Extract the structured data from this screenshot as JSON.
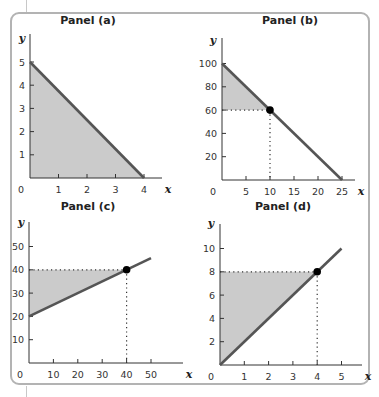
{
  "chart_data": [
    {
      "type": "line",
      "title": "Panel (a)",
      "xlabel": "x",
      "ylabel": "y",
      "xlim": [
        0,
        4.5
      ],
      "ylim": [
        0,
        5.5
      ],
      "xticks": [
        1,
        2,
        3,
        4
      ],
      "yticks": [
        1,
        2,
        3,
        4,
        5
      ],
      "origin_label": "0",
      "series": [
        {
          "name": "line",
          "x": [
            0,
            4
          ],
          "y": [
            5,
            0
          ]
        }
      ],
      "shaded_region": {
        "points": [
          [
            0,
            0
          ],
          [
            0,
            5
          ],
          [
            4,
            0
          ]
        ]
      },
      "highlight_point": null,
      "grid": false
    },
    {
      "type": "line",
      "title": "Panel (b)",
      "xlabel": "x",
      "ylabel": "y",
      "xlim": [
        0,
        27
      ],
      "ylim": [
        0,
        110
      ],
      "xticks": [
        5,
        10,
        15,
        20,
        25
      ],
      "yticks": [
        20,
        40,
        60,
        80,
        100
      ],
      "origin_label": "0",
      "series": [
        {
          "name": "line",
          "x": [
            0,
            25
          ],
          "y": [
            100,
            0
          ]
        }
      ],
      "shaded_region": {
        "points": [
          [
            0,
            60
          ],
          [
            0,
            100
          ],
          [
            10,
            60
          ]
        ]
      },
      "highlight_point": {
        "x": 10,
        "y": 60
      },
      "grid": false
    },
    {
      "type": "line",
      "title": "Panel (c)",
      "xlabel": "x",
      "ylabel": "y",
      "xlim": [
        0,
        55
      ],
      "ylim": [
        0,
        55
      ],
      "xticks": [
        10,
        20,
        30,
        40,
        50
      ],
      "yticks": [
        10,
        20,
        30,
        40,
        50
      ],
      "origin_label": "0",
      "series": [
        {
          "name": "line",
          "x": [
            0,
            50
          ],
          "y": [
            20,
            45
          ]
        }
      ],
      "shaded_region": {
        "points": [
          [
            0,
            20
          ],
          [
            0,
            40
          ],
          [
            40,
            40
          ]
        ]
      },
      "highlight_point": {
        "x": 40,
        "y": 40
      },
      "grid": false
    },
    {
      "type": "line",
      "title": "Panel (d)",
      "xlabel": "x",
      "ylabel": "y",
      "xlim": [
        0,
        5.5
      ],
      "ylim": [
        0,
        11
      ],
      "xticks": [
        1,
        2,
        3,
        4,
        5
      ],
      "yticks": [
        2,
        4,
        6,
        8,
        10
      ],
      "origin_label": "0",
      "series": [
        {
          "name": "line",
          "x": [
            0,
            5
          ],
          "y": [
            0,
            10
          ]
        }
      ],
      "shaded_region": {
        "points": [
          [
            0,
            0
          ],
          [
            0,
            8
          ],
          [
            4,
            8
          ]
        ]
      },
      "highlight_point": {
        "x": 4,
        "y": 8
      },
      "grid": false
    }
  ],
  "colors": {
    "line": "#555555",
    "fill": "#cbcbcb",
    "axis": "#333333",
    "point": "#000000",
    "frame": "#b3b3b3"
  },
  "layout": [
    {
      "ox": 30,
      "oy": 178,
      "px": 28.5,
      "py": 23.2,
      "title_x": 88,
      "title_y": 24,
      "ylabel_x": 22,
      "ylabel_y": 42,
      "axis_top": 34,
      "axis_right": 162
    },
    {
      "ox": 222,
      "oy": 180,
      "px": 4.8,
      "py": 1.165,
      "title_x": 290,
      "title_y": 24,
      "ylabel_x": 213,
      "ylabel_y": 44,
      "axis_top": 38,
      "axis_right": 355
    },
    {
      "ox": 29,
      "oy": 363,
      "px": 2.44,
      "py": 2.33,
      "title_x": 88,
      "title_y": 210,
      "ylabel_x": 21,
      "ylabel_y": 226,
      "axis_top": 222,
      "axis_right": 183
    },
    {
      "ox": 220,
      "oy": 365,
      "px": 24.3,
      "py": 11.65,
      "title_x": 283,
      "title_y": 210,
      "ylabel_x": 211,
      "ylabel_y": 227,
      "axis_top": 224,
      "axis_right": 362
    }
  ]
}
